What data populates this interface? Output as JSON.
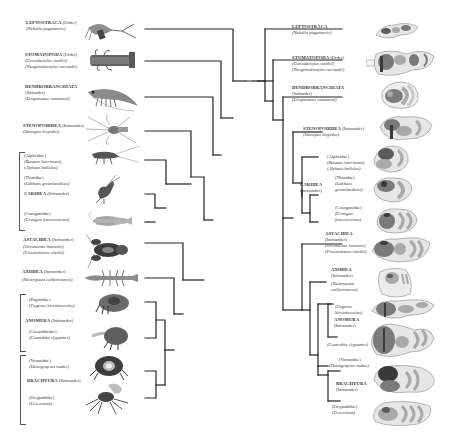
{
  "figure": {
    "type": "mirrored-phylogeny",
    "left_panel": "animal habitus illustrations with cladogram",
    "right_panel": "cladogram with brain/neuroanatomy schematics"
  },
  "left": {
    "taxa": [
      {
        "group": "LEPTOSTRACA",
        "rank": "(Order)",
        "species": [
          "(Nebalia pugettensis)"
        ],
        "y": 29
      },
      {
        "group": "STOMATOPODA",
        "rank": "(Order)",
        "species": [
          "(Gonodactylus smithii)",
          "(Neogonodactylus oerstedii)"
        ],
        "y": 61
      },
      {
        "group": "DENDROBRANCHIATA",
        "rank": "(Suborder)",
        "species": [
          "(Litopenaeus vannamei)"
        ],
        "y": 97
      },
      {
        "group": "STENOPODIDEA",
        "rank": "(Infraorder)",
        "species": [
          "(Stenopus hispidus)"
        ],
        "y": 131
      },
      {
        "group": "",
        "rank": "",
        "species": [
          "(Alpheidae)",
          "(Betaeus harrimani)",
          "(Alpheus bellulus)"
        ],
        "y": 160
      },
      {
        "group": "",
        "rank": "",
        "species": [
          "(Thoridae)",
          "(Lebbeus groenlandicus)"
        ],
        "y": 194
      },
      {
        "group": "CARIDEA",
        "rank": "(Infraorder)",
        "species": [],
        "y": 207
      },
      {
        "group": "",
        "rank": "",
        "species": [
          "(Crangonidae)",
          "(Crangon franciscorum)"
        ],
        "y": 222
      },
      {
        "group": "ASTACIDEA",
        "rank": "(Infraorder)",
        "species": [
          "(Orconectes immunis)",
          "(Procambarus clarkii)"
        ],
        "y": 243
      },
      {
        "group": "AXIIDEA",
        "rank": "(Infraorder)",
        "species": [
          "(Neotrypaea californiensis)"
        ],
        "y": 278
      },
      {
        "group": "",
        "rank": "",
        "species": [
          "(Paguridae)",
          "(Pagurus hirsutiusculus)"
        ],
        "y": 302
      },
      {
        "group": "ANOMURA",
        "rank": "(Infraorder)",
        "species": [],
        "y": 320
      },
      {
        "group": "",
        "rank": "",
        "species": [
          "(Coenobitidae)",
          "(Coenobita clypeatus)"
        ],
        "y": 338
      },
      {
        "group": "",
        "rank": "",
        "species": [
          "(Varunidae)",
          "(Hemigrapsus nudus)"
        ],
        "y": 371
      },
      {
        "group": "BRACHYURA",
        "rank": "(Infraorder)",
        "species": [],
        "y": 381
      },
      {
        "group": "",
        "rank": "",
        "species": [
          "(Ocypodidae)",
          "(Uca minax)"
        ],
        "y": 398
      }
    ]
  },
  "right": {
    "taxa": [
      {
        "group": "LEPTOSTRACA",
        "rank": "",
        "species": [
          "(Nebalia pugettensis)"
        ]
      },
      {
        "group": "STOMATOPODA",
        "rank": "(Order)",
        "species": [
          "(Gonodactylus smithii)",
          "(Neogonodactylus oerstedii)"
        ]
      },
      {
        "group": "DENDROBRANCHIATA",
        "rank": "(Suborder)",
        "species": [
          "(Litopenaeus vannamei)"
        ]
      },
      {
        "group": "STENOPODIDEA",
        "rank": "(Infraorder)",
        "species": [
          "(Stenopus hispidus)"
        ]
      },
      {
        "group": "",
        "rank": "",
        "species": [
          "(Alpheidae)",
          "(Betaeus harrimani)",
          "(Alpheus bellulus)"
        ]
      },
      {
        "group": "CARIDEA",
        "rank": "(Infraorder)",
        "species": []
      },
      {
        "group": "",
        "rank": "",
        "species": [
          "(Thoridae)",
          "(Lebbeus",
          "groenlandicus)"
        ]
      },
      {
        "group": "",
        "rank": "",
        "species": [
          "(Crangonidae)",
          "(Crangon",
          "franciscorum)"
        ]
      },
      {
        "group": "ASTACIDEA",
        "rank": "(Infraorder)",
        "species": [
          "(Orconectes immunis)",
          "(Procambarus clarkii)"
        ]
      },
      {
        "group": "AXIIDEA",
        "rank": "(Infraorder)",
        "species": [
          "(Neotrypaea",
          "californiensis)"
        ]
      },
      {
        "group": "",
        "rank": "",
        "species": [
          "(Pagurus",
          "hirsutiusculus)"
        ]
      },
      {
        "group": "ANOMURA",
        "rank": "(Infraorder)",
        "species": []
      },
      {
        "group": "",
        "rank": "",
        "species": [
          "(Coenobita clypeatus)"
        ]
      },
      {
        "group": "",
        "rank": "",
        "species": [
          "(Varunidae)",
          "(Hemigrapsus nudus)"
        ]
      },
      {
        "group": "BRACHYURA",
        "rank": "(Infraorder)",
        "species": []
      },
      {
        "group": "",
        "rank": "",
        "species": [
          "(Ocypodidae)",
          "(Uca minax)"
        ]
      }
    ]
  },
  "colors": {
    "tree_line": "#222222",
    "bracket": "#555555",
    "brain_outline": "#8a8a8a",
    "brain_fill_light": "#e6e6e6",
    "brain_fill_mid": "#a9a9a9",
    "brain_fill_dark": "#5b5b5b",
    "brain_accent": "#3a3a3a"
  }
}
